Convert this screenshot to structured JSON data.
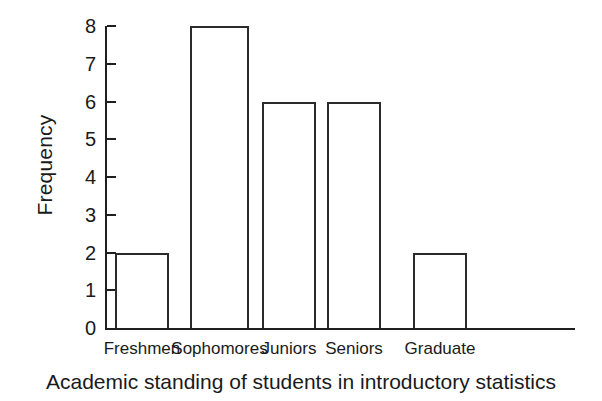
{
  "chart_data": {
    "type": "bar",
    "title": "",
    "caption": "Academic standing of students in introductory statistics",
    "categories": [
      "Freshmen",
      "Sophomores",
      "Juniors",
      "Seniors",
      "Graduate"
    ],
    "values": [
      2,
      8,
      6,
      6,
      2
    ],
    "xlabel": "Academic standing of students in introductory statistics",
    "ylabel": "Frequency",
    "ylim": [
      0,
      8
    ],
    "ytick_labels": [
      "8",
      "7",
      "6",
      "5",
      "4",
      "3",
      "2",
      "1",
      "0"
    ],
    "ytick_values": [
      8,
      7,
      6,
      5,
      4,
      3,
      2,
      1,
      0
    ],
    "grid": false,
    "legend": null,
    "bar_fill_color": "#ffffff",
    "bar_edge_color": "#2b2b2b",
    "axis_color": "#1f1f1f",
    "background_color": "#ffffff"
  },
  "axes": {
    "y_label_text": "Frequency"
  },
  "figure": {
    "caption_text": "Academic standing of students in introductory statistics"
  }
}
